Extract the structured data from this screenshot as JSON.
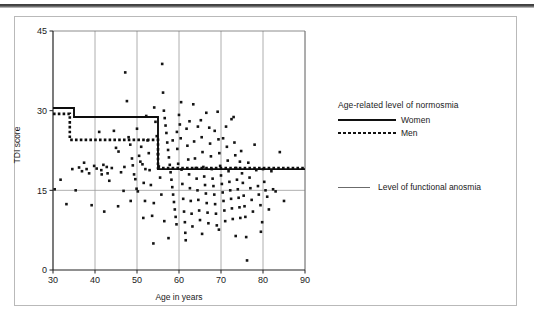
{
  "figure": {
    "legend_title": "Age-related level of normosmia",
    "series_women_label": "Women",
    "series_men_label": "Men",
    "anosmia_label": "Level of functional anosmia"
  },
  "chart_data": {
    "type": "scatter",
    "title": "",
    "xlabel": "Age in years",
    "ylabel": "TDI score",
    "xlim": [
      30,
      90
    ],
    "ylim": [
      0,
      45
    ],
    "xticks": [
      30,
      40,
      50,
      60,
      70,
      80,
      90
    ],
    "yticks": [
      0,
      15,
      30,
      45
    ],
    "grid": "vertical gridlines at every x tick, horizontal gridline at y=15",
    "legend_position": "right-outside",
    "marker": "filled black square",
    "series": [
      {
        "name": "TDI score by age",
        "type": "scatter",
        "points": [
          [
            30.4,
            15.2
          ],
          [
            31.8,
            17.0
          ],
          [
            33.2,
            12.4
          ],
          [
            34.6,
            19.0
          ],
          [
            35.4,
            15.0
          ],
          [
            36.2,
            19.3
          ],
          [
            36.9,
            18.6
          ],
          [
            37.4,
            20.2
          ],
          [
            38.0,
            19.0
          ],
          [
            38.6,
            18.2
          ],
          [
            39.2,
            12.2
          ],
          [
            39.8,
            19.6
          ],
          [
            40.4,
            19.1
          ],
          [
            41.0,
            26.0
          ],
          [
            41.6,
            18.0
          ],
          [
            42.2,
            11.0
          ],
          [
            42.8,
            19.4
          ],
          [
            43.4,
            16.8
          ],
          [
            44.0,
            19.2
          ],
          [
            44.5,
            26.2
          ],
          [
            45.0,
            23.0
          ],
          [
            45.6,
            22.3
          ],
          [
            46.2,
            18.4
          ],
          [
            46.8,
            14.9
          ],
          [
            47.2,
            37.2
          ],
          [
            47.6,
            31.8
          ],
          [
            48.0,
            25.0
          ],
          [
            48.4,
            23.6
          ],
          [
            48.8,
            21.0
          ],
          [
            49.0,
            19.7
          ],
          [
            49.3,
            18.0
          ],
          [
            49.6,
            17.1
          ],
          [
            49.9,
            15.3
          ],
          [
            50.2,
            14.8
          ],
          [
            50.5,
            21.5
          ],
          [
            50.8,
            20.4
          ],
          [
            51.0,
            23.2
          ],
          [
            51.3,
            19.9
          ],
          [
            51.6,
            16.4
          ],
          [
            51.9,
            13.0
          ],
          [
            52.2,
            29.0
          ],
          [
            52.5,
            24.4
          ],
          [
            52.8,
            22.0
          ],
          [
            53.0,
            18.8
          ],
          [
            53.3,
            16.0
          ],
          [
            53.6,
            10.2
          ],
          [
            53.9,
            5.0
          ],
          [
            54.1,
            30.6
          ],
          [
            54.4,
            27.9
          ],
          [
            54.7,
            25.2
          ],
          [
            55.0,
            21.8
          ],
          [
            55.2,
            19.5
          ],
          [
            55.5,
            17.4
          ],
          [
            55.8,
            14.2
          ],
          [
            56.0,
            38.8
          ],
          [
            56.2,
            33.4
          ],
          [
            56.4,
            30.0
          ],
          [
            56.6,
            28.6
          ],
          [
            56.8,
            27.2
          ],
          [
            57.0,
            25.8
          ],
          [
            57.2,
            24.0
          ],
          [
            57.4,
            22.6
          ],
          [
            57.6,
            21.2
          ],
          [
            57.8,
            19.8
          ],
          [
            58.0,
            18.4
          ],
          [
            58.2,
            17.0
          ],
          [
            58.4,
            15.6
          ],
          [
            58.6,
            14.2
          ],
          [
            58.8,
            12.8
          ],
          [
            59.0,
            11.4
          ],
          [
            59.2,
            10.0
          ],
          [
            59.4,
            8.6
          ],
          [
            59.6,
            22.8
          ],
          [
            59.8,
            20.0
          ],
          [
            60.0,
            29.2
          ],
          [
            60.2,
            27.4
          ],
          [
            60.4,
            24.8
          ],
          [
            60.6,
            18.9
          ],
          [
            60.8,
            16.2
          ],
          [
            61.0,
            13.4
          ],
          [
            61.2,
            11.0
          ],
          [
            61.4,
            9.0
          ],
          [
            61.6,
            5.6
          ],
          [
            61.8,
            26.6
          ],
          [
            62.0,
            23.4
          ],
          [
            62.2,
            20.8
          ],
          [
            62.4,
            18.0
          ],
          [
            62.6,
            15.4
          ],
          [
            62.8,
            13.0
          ],
          [
            63.0,
            10.6
          ],
          [
            63.2,
            8.2
          ],
          [
            63.4,
            31.2
          ],
          [
            63.6,
            24.2
          ],
          [
            63.8,
            21.0
          ],
          [
            64.0,
            19.2
          ],
          [
            64.2,
            17.2
          ],
          [
            64.4,
            15.0
          ],
          [
            64.6,
            13.2
          ],
          [
            64.8,
            11.2
          ],
          [
            65.0,
            9.4
          ],
          [
            65.2,
            28.2
          ],
          [
            65.4,
            25.0
          ],
          [
            65.6,
            22.2
          ],
          [
            65.8,
            19.4
          ],
          [
            66.0,
            17.6
          ],
          [
            66.2,
            16.0
          ],
          [
            66.4,
            14.4
          ],
          [
            66.6,
            12.6
          ],
          [
            66.8,
            10.8
          ],
          [
            67.0,
            8.8
          ],
          [
            67.2,
            26.8
          ],
          [
            67.4,
            23.8
          ],
          [
            67.6,
            21.4
          ],
          [
            67.8,
            19.0
          ],
          [
            68.0,
            17.2
          ],
          [
            68.2,
            15.8
          ],
          [
            68.4,
            14.2
          ],
          [
            68.6,
            12.4
          ],
          [
            68.8,
            10.6
          ],
          [
            69.0,
            8.4
          ],
          [
            69.2,
            29.8
          ],
          [
            69.4,
            24.6
          ],
          [
            69.6,
            22.0
          ],
          [
            69.8,
            19.6
          ],
          [
            70.0,
            17.8
          ],
          [
            70.2,
            16.2
          ],
          [
            70.4,
            14.6
          ],
          [
            70.6,
            13.0
          ],
          [
            70.8,
            11.2
          ],
          [
            71.0,
            9.2
          ],
          [
            71.2,
            27.0
          ],
          [
            71.4,
            23.2
          ],
          [
            71.6,
            20.6
          ],
          [
            71.8,
            18.6
          ],
          [
            72.0,
            16.6
          ],
          [
            72.2,
            15.0
          ],
          [
            72.4,
            13.4
          ],
          [
            72.6,
            11.6
          ],
          [
            72.8,
            9.6
          ],
          [
            73.0,
            28.8
          ],
          [
            73.2,
            24.0
          ],
          [
            73.4,
            21.6
          ],
          [
            73.6,
            19.2
          ],
          [
            73.8,
            17.0
          ],
          [
            74.0,
            15.2
          ],
          [
            74.2,
            13.6
          ],
          [
            74.4,
            11.8
          ],
          [
            74.6,
            9.8
          ],
          [
            74.8,
            22.4
          ],
          [
            75.0,
            18.2
          ],
          [
            75.2,
            16.4
          ],
          [
            75.4,
            14.0
          ],
          [
            75.6,
            12.0
          ],
          [
            75.8,
            10.0
          ],
          [
            76.0,
            6.2
          ],
          [
            76.2,
            1.8
          ],
          [
            76.5,
            20.2
          ],
          [
            76.8,
            17.4
          ],
          [
            77.0,
            15.4
          ],
          [
            77.3,
            13.2
          ],
          [
            77.6,
            11.0
          ],
          [
            78.0,
            23.6
          ],
          [
            78.4,
            18.8
          ],
          [
            78.8,
            15.8
          ],
          [
            79.0,
            14.2
          ],
          [
            79.4,
            12.2
          ],
          [
            79.8,
            9.0
          ],
          [
            80.0,
            19.0
          ],
          [
            80.3,
            16.6
          ],
          [
            80.6,
            15.0
          ],
          [
            81.0,
            13.8
          ],
          [
            81.4,
            11.4
          ],
          [
            82.0,
            18.6
          ],
          [
            82.4,
            15.2
          ],
          [
            83.0,
            14.8
          ],
          [
            84.0,
            22.2
          ],
          [
            85.0,
            13.0
          ],
          [
            47.0,
            19.4
          ],
          [
            50.0,
            26.6
          ],
          [
            52.0,
            19.0
          ],
          [
            54.0,
            12.6
          ],
          [
            58.5,
            24.4
          ],
          [
            59.5,
            26.0
          ],
          [
            60.5,
            31.6
          ],
          [
            62.5,
            28.0
          ],
          [
            64.5,
            27.0
          ],
          [
            66.5,
            29.6
          ],
          [
            68.5,
            26.2
          ],
          [
            70.5,
            24.8
          ],
          [
            72.5,
            28.4
          ],
          [
            74.5,
            20.4
          ],
          [
            45.5,
            12.0
          ],
          [
            43.0,
            18.2
          ],
          [
            42.0,
            19.8
          ],
          [
            41.5,
            18.8
          ],
          [
            48.5,
            13.0
          ],
          [
            51.5,
            9.8
          ],
          [
            56.5,
            9.2
          ],
          [
            57.5,
            6.0
          ],
          [
            61.5,
            7.0
          ],
          [
            65.5,
            6.8
          ],
          [
            69.5,
            7.6
          ],
          [
            73.5,
            6.4
          ],
          [
            79.5,
            7.2
          ]
        ]
      },
      {
        "name": "Women",
        "type": "step",
        "style": "solid",
        "points": [
          [
            30,
            30.5
          ],
          [
            35,
            30.5
          ],
          [
            35,
            28.8
          ],
          [
            55,
            28.8
          ],
          [
            55,
            19.0
          ],
          [
            90,
            19.0
          ]
        ]
      },
      {
        "name": "Men",
        "type": "step",
        "style": "dotted",
        "points": [
          [
            30,
            29.4
          ],
          [
            34,
            29.4
          ],
          [
            34,
            24.5
          ],
          [
            55,
            24.5
          ],
          [
            55,
            19.2
          ],
          [
            90,
            19.2
          ]
        ]
      },
      {
        "name": "Level of functional anosmia",
        "type": "hline",
        "value": 15
      }
    ]
  }
}
